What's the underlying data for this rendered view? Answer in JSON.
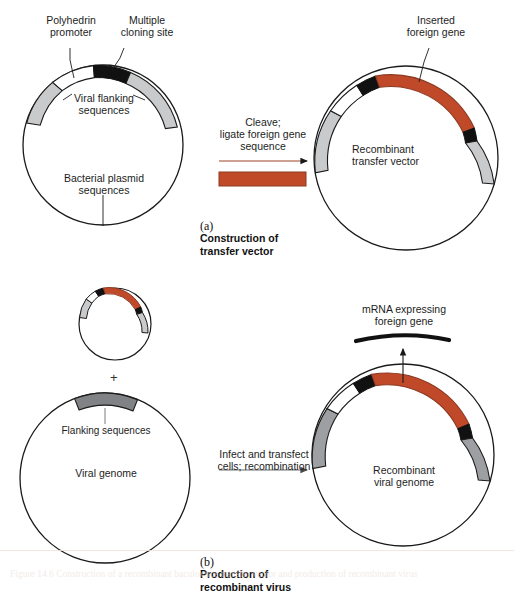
{
  "figure": {
    "title_alt": "Baculovirus expression system: construction of transfer vector and production of recombinant virus",
    "colors": {
      "foreign_gene": "#c0492a",
      "cloning_site": "#111111",
      "viral_flanking": "#c9cacb",
      "genome_flanking": "#808285",
      "promoter_white": "#ffffff",
      "outline": "#1a1a1a",
      "arrow_rust": "#9e4426",
      "arrow_gray": "#6d6e71",
      "text": "#1d1d1d"
    }
  },
  "panel_a": {
    "labels": {
      "polyhedrin_promoter": "Polyhedrin\npromoter",
      "multiple_cloning_site": "Multiple\ncloning site",
      "viral_flanking_sequences": "Viral flanking\nsequences",
      "bacterial_plasmid_sequences": "Bacterial plasmid\nsequences",
      "inserted_foreign_gene": "Inserted\nforeign gene",
      "recombinant_transfer_vector": "Recombinant\ntransfer vector"
    },
    "step": {
      "text": "Cleave;\nligate foreign gene\nsequence"
    },
    "caption": {
      "marker": "(a)",
      "text": "Construction of\ntransfer vector"
    }
  },
  "panel_b": {
    "labels": {
      "plus": "+",
      "flanking_sequences": "Flanking sequences",
      "viral_genome": "Viral genome",
      "mrna_expressing_foreign_gene": "mRNA expressing\nforeign gene",
      "recombinant_viral_genome": "Recombinant\nviral genome"
    },
    "step": {
      "text": "Infect and transfect\ncells; recombination"
    },
    "caption": {
      "marker": "(b)",
      "text": "Production of\nrecombinant virus"
    }
  },
  "footer": {
    "figure_caption": "Figure 14.6  Construction of a recombinant baculovirus transfer vector and production of recombinant virus"
  }
}
